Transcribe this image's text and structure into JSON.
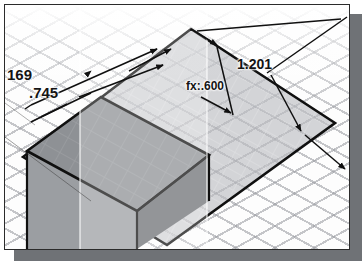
{
  "app": {
    "kind": "cad-3d-viewport",
    "view": "isometric",
    "grid": {
      "visible": true,
      "style": "isometric-diamond",
      "color": "#96989e"
    },
    "background_color": "#fdfdfd",
    "panel_shadow_color": "#6f7276",
    "border_color": "#2b2b2b"
  },
  "geometry": {
    "solid": {
      "name": "extruded-box",
      "top_face_color": "#8e9195",
      "left_face_color": "#9ea1a5",
      "front_face_color": "#6e7175",
      "edge_color": "#101010"
    },
    "sketch_plane": {
      "name": "work-plane",
      "fill_color": "#b9bcc0",
      "opacity": 0.55,
      "outline_color": "#101010"
    },
    "transparent_slab": {
      "name": "translucent-work-plane-band",
      "fill_color": "#ffffff",
      "opacity": 0.3
    }
  },
  "dimensions": [
    {
      "id": "dim-169",
      "label": "169",
      "value": "169",
      "truncated": true,
      "kind": "linear-dimension"
    },
    {
      "id": "dim-745",
      "label": ".745",
      "value": ".745",
      "truncated": false,
      "kind": "linear-dimension"
    },
    {
      "id": "dim-600",
      "label": "fx:.600",
      "value": ".600",
      "truncated": false,
      "kind": "driven-parametric-dimension",
      "prefix": "fx:"
    },
    {
      "id": "dim-1201",
      "label": "1.201",
      "value": "1.201",
      "truncated": false,
      "kind": "linear-dimension"
    }
  ],
  "annotation_style": {
    "text_color": "#141414",
    "leader_color": "#101010",
    "arrow_style": "filled-closed"
  }
}
